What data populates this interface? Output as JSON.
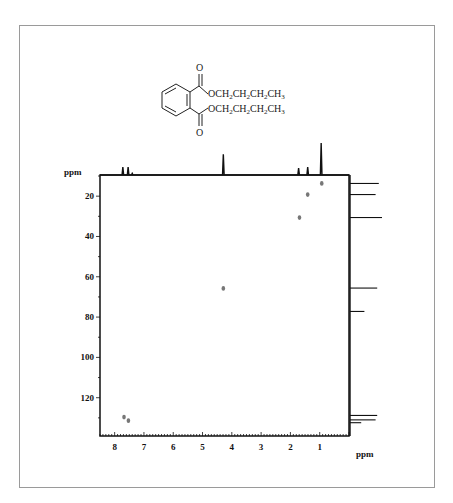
{
  "figure": {
    "title": "",
    "molecule": {
      "name": "dibutyl phthalate",
      "top_label": "OCH2CH2CH2CH3",
      "bottom_label": "OCH2CH2CH2CH3",
      "carbonyl_O_top": "O",
      "carbonyl_O_bottom": "O"
    }
  },
  "chart_data": {
    "type": "scatter",
    "xlabel": "ppm",
    "ylabel": "ppm",
    "x_axis": {
      "label": "ppm",
      "reversed": true,
      "range": [
        8.5,
        0.0
      ],
      "ticks": [
        8,
        7,
        6,
        5,
        4,
        3,
        2,
        1
      ],
      "tick_labels": [
        "8",
        "7",
        "6",
        "5",
        "4",
        "3",
        "2",
        "1"
      ]
    },
    "y_axis": {
      "label": "ppm",
      "reversed": true,
      "range": [
        9.5,
        139
      ],
      "ticks": [
        20,
        40,
        60,
        80,
        100,
        120
      ],
      "tick_labels": [
        "20",
        "40",
        "60",
        "80",
        "100",
        "120"
      ]
    },
    "grid": false,
    "series": [
      {
        "name": "cross peaks",
        "points": [
          {
            "x": 0.93,
            "y": 13.7
          },
          {
            "x": 1.41,
            "y": 19.2
          },
          {
            "x": 1.69,
            "y": 30.6
          },
          {
            "x": 4.29,
            "y": 65.8
          },
          {
            "x": 7.68,
            "y": 129.6
          },
          {
            "x": 7.53,
            "y": 131.4
          }
        ]
      }
    ],
    "projection_1H_top": {
      "peaks": [
        {
          "x": 7.72,
          "height": 0.25
        },
        {
          "x": 7.54,
          "height": 0.25
        },
        {
          "x": 7.4,
          "height": 0.05
        },
        {
          "x": 4.29,
          "height": 0.65
        },
        {
          "x": 1.72,
          "height": 0.22
        },
        {
          "x": 1.41,
          "height": 0.25
        },
        {
          "x": 0.95,
          "height": 1.0
        }
      ]
    },
    "projection_13C_right": {
      "peaks": [
        {
          "y": 13.7,
          "length": 0.9
        },
        {
          "y": 19.2,
          "length": 0.8
        },
        {
          "y": 30.6,
          "length": 1.0
        },
        {
          "y": 65.6,
          "length": 0.85
        },
        {
          "y": 77.2,
          "length": 0.45
        },
        {
          "y": 128.8,
          "length": 0.85
        },
        {
          "y": 131.0,
          "length": 0.8
        },
        {
          "y": 132.4,
          "length": 0.35
        }
      ]
    }
  }
}
